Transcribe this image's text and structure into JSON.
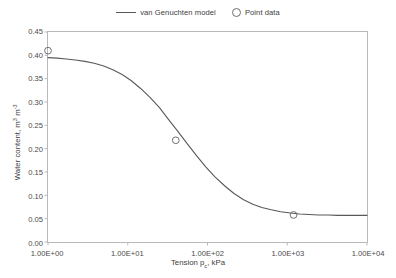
{
  "legend": {
    "position": "top-center",
    "items": [
      {
        "label": "van Genuchten model",
        "marker": "line-icon",
        "color": "#59595b"
      },
      {
        "label": "Point data",
        "marker": "open-circle-icon",
        "color": "#6f6f72"
      }
    ]
  },
  "axes": {
    "x": {
      "title_prefix": "Tension p",
      "title_sub": "c",
      "title_suffix": ", kPa",
      "scale": "log10",
      "min": 1,
      "max": 10000,
      "ticks": [
        "1.00E+00",
        "1.00E+01",
        "1.00E+02",
        "1.00E+03",
        "1.00E+04"
      ],
      "tick_values": [
        1,
        10,
        100,
        1000,
        10000
      ]
    },
    "y": {
      "title_prefix": "Water content, m",
      "title_sup1": "3",
      "title_mid": " m",
      "title_sup2": "-3",
      "scale": "linear",
      "min": 0,
      "max": 0.45,
      "step": 0.05,
      "ticks": [
        "0.00",
        "0.05",
        "0.10",
        "0.15",
        "0.20",
        "0.25",
        "0.30",
        "0.35",
        "0.40",
        "0.45"
      ],
      "tick_values": [
        0,
        0.05,
        0.1,
        0.15,
        0.2,
        0.25,
        0.3,
        0.35,
        0.4,
        0.45
      ]
    }
  },
  "chart_data": {
    "type": "line",
    "title": "",
    "xlabel": "Tension pc, kPa",
    "ylabel": "Water content, m3 m-3",
    "xscale": "log",
    "xlim": [
      1,
      10000
    ],
    "ylim": [
      0,
      0.45
    ],
    "grid": false,
    "legend_position": "top-center",
    "series": [
      {
        "name": "van Genuchten model",
        "type": "line",
        "color": "#59595b",
        "x": [
          1,
          1.3,
          1.7,
          2.2,
          2.9,
          3.8,
          5,
          6.5,
          8.5,
          11,
          14.5,
          19,
          25,
          32,
          42,
          55,
          72,
          95,
          125,
          165,
          215,
          280,
          370,
          480,
          630,
          830,
          1090,
          1430,
          1880,
          2470,
          3250,
          4270,
          5610,
          7380,
          10000
        ],
        "y": [
          0.395,
          0.394,
          0.392,
          0.39,
          0.387,
          0.383,
          0.377,
          0.369,
          0.359,
          0.346,
          0.329,
          0.31,
          0.288,
          0.264,
          0.238,
          0.212,
          0.186,
          0.161,
          0.139,
          0.12,
          0.104,
          0.091,
          0.081,
          0.074,
          0.069,
          0.065,
          0.062,
          0.06,
          0.059,
          0.058,
          0.058,
          0.057,
          0.057,
          0.057,
          0.057
        ]
      },
      {
        "name": "Point data",
        "type": "scatter",
        "marker": "open-circle",
        "color": "#6f6f72",
        "x": [
          1,
          40,
          1200
        ],
        "y": [
          0.41,
          0.218,
          0.058
        ]
      }
    ]
  }
}
